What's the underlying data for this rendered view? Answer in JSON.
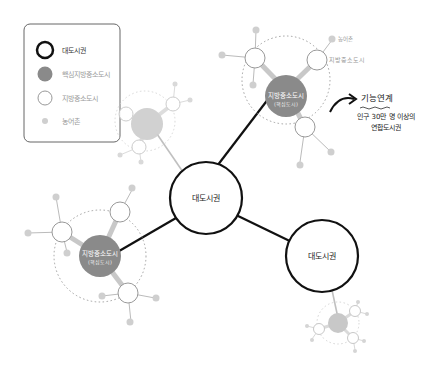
{
  "legend": {
    "items": [
      {
        "label": "대도시권",
        "symbol": "metro"
      },
      {
        "label": "핵심지방중소도시",
        "symbol": "core-city"
      },
      {
        "label": "지방중소도시",
        "symbol": "local-city"
      },
      {
        "label": "농어촌",
        "symbol": "rural"
      }
    ]
  },
  "nodes": {
    "metro_center": "대도시권",
    "metro_right": "대도시권",
    "core_top_line1": "지방중소도시",
    "core_top_line2": "(핵심도시)",
    "core_left_line1": "지방중소도시",
    "core_left_line2": "(핵심도시)",
    "annot_rural": "농어촌",
    "annot_local": "지방중소도시"
  },
  "callout": {
    "title": "기능연계",
    "line1": "인구 30만 명 이상의",
    "line2": "연합도시권"
  },
  "colors": {
    "metro_stroke": "#111111",
    "core_fill": "#8a8a8a",
    "light_fill": "#c8c8c8",
    "rural_fill": "#cfcfcf",
    "local_stroke": "#9a9a9a",
    "dotted": "#a0a0a0"
  }
}
